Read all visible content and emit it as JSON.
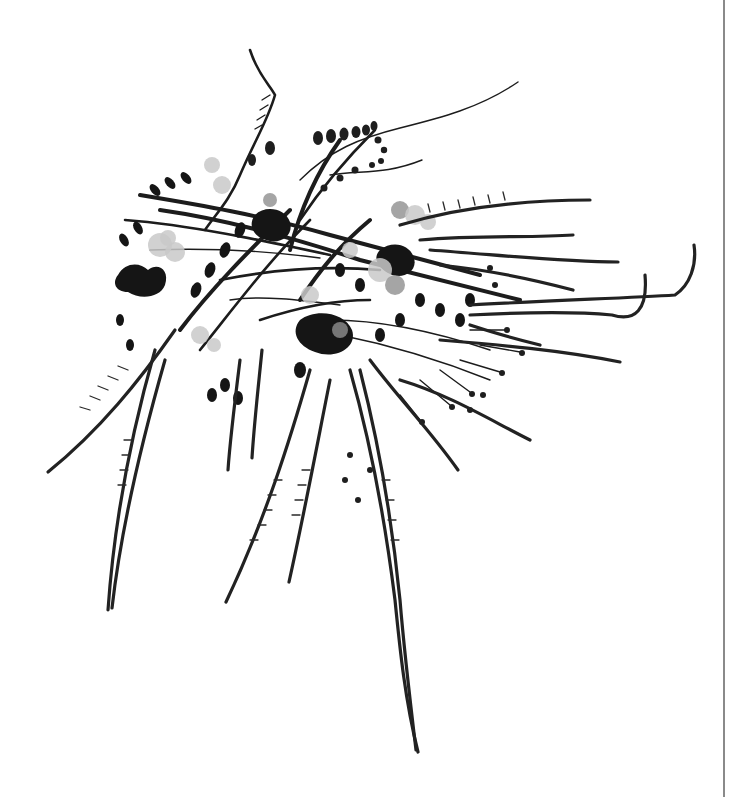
{
  "image": {
    "subject": "grayscale photograph of a flowering plant cluster with long trailing seed pods and tendrils",
    "background_color": "#ffffff",
    "ink_color": "#1c1c1c",
    "flower_tone": "#c9c9c9",
    "width": 746,
    "height": 797
  },
  "divider": {
    "orientation": "vertical",
    "x": 723,
    "color": "#8a8a8a"
  },
  "elements": {
    "plant_cluster": "plant-cluster",
    "trailing_pods": "trailing-seed-pods",
    "curling_tendrils": "curling-tendrils",
    "flowers": "pale-flower-clusters"
  }
}
